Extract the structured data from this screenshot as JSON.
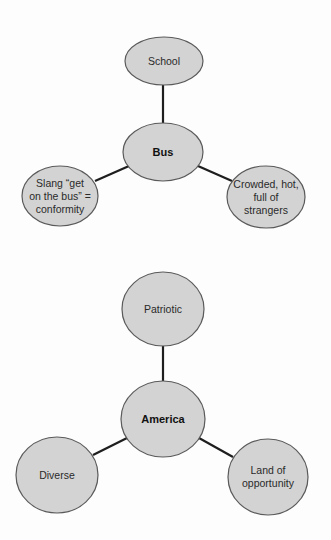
{
  "colors": {
    "background": "#fdfdfd",
    "node_fill": "#d3d3d3",
    "node_stroke": "#5a5a5a",
    "edge": "#1e1e1e",
    "text": "#2a2a2a"
  },
  "diagrams": [
    {
      "center": {
        "label": "Bus",
        "lines": [
          "Bus"
        ]
      },
      "nodes": [
        {
          "position": "top",
          "lines": [
            "School"
          ]
        },
        {
          "position": "left",
          "lines": [
            "Slang “get",
            "on the bus” =",
            "conformity"
          ]
        },
        {
          "position": "right",
          "lines": [
            "Crowded, hot,",
            "full of",
            "strangers"
          ]
        }
      ]
    },
    {
      "center": {
        "label": "America",
        "lines": [
          "America"
        ]
      },
      "nodes": [
        {
          "position": "top",
          "lines": [
            "Patriotic"
          ]
        },
        {
          "position": "left",
          "lines": [
            "Diverse"
          ]
        },
        {
          "position": "right",
          "lines": [
            "Land of",
            "opportunity"
          ]
        }
      ]
    }
  ]
}
